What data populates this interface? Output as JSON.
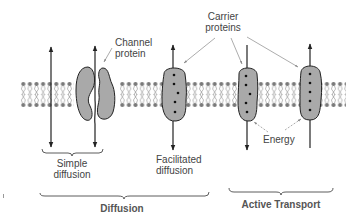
{
  "diagram": {
    "colors": {
      "background": "#ffffff",
      "protein_fill": "#a9a9a9",
      "outline": "#222222",
      "lipid": "#7a7a7a",
      "text": "#444444",
      "brace_text": "#555555"
    },
    "labels": {
      "channel_protein_line1": "Channel",
      "channel_protein_line2": "protein",
      "carrier_proteins_line1": "Carrier",
      "carrier_proteins_line2": "proteins",
      "energy": "Energy",
      "simple_diffusion_line1": "Simple",
      "simple_diffusion_line2": "diffusion",
      "facilitated_diffusion_line1": "Facilitated",
      "facilitated_diffusion_line2": "diffusion",
      "diffusion_group": "Diffusion",
      "active_transport_group": "Active Transport"
    },
    "nodes": [
      {
        "id": "simple-diffusion",
        "type": "arrow-bidirectional",
        "label": "Simple diffusion"
      },
      {
        "id": "channel-protein",
        "type": "protein-channel",
        "label": "Channel protein"
      },
      {
        "id": "facilitated-carrier",
        "type": "protein-carrier",
        "label": "Facilitated diffusion"
      },
      {
        "id": "active-carrier-1",
        "type": "protein-carrier",
        "label": "Active transport (inward)"
      },
      {
        "id": "active-carrier-2",
        "type": "protein-carrier",
        "label": "Active transport (outward)"
      }
    ],
    "groups": [
      {
        "id": "diffusion",
        "label": "Diffusion",
        "members": [
          "simple-diffusion",
          "channel-protein",
          "facilitated-carrier"
        ]
      },
      {
        "id": "active-transport",
        "label": "Active Transport",
        "members": [
          "active-carrier-1",
          "active-carrier-2"
        ]
      }
    ],
    "edges": [
      {
        "from": "carrier-proteins-label",
        "to": "facilitated-carrier",
        "style": "pointer"
      },
      {
        "from": "carrier-proteins-label",
        "to": "active-carrier-1",
        "style": "pointer"
      },
      {
        "from": "carrier-proteins-label",
        "to": "active-carrier-2",
        "style": "pointer"
      },
      {
        "from": "channel-protein-label",
        "to": "channel-protein",
        "style": "pointer"
      },
      {
        "from": "energy-label",
        "to": "active-carrier-1",
        "style": "dashed-pointer"
      },
      {
        "from": "energy-label",
        "to": "active-carrier-2",
        "style": "dashed-pointer"
      }
    ]
  }
}
